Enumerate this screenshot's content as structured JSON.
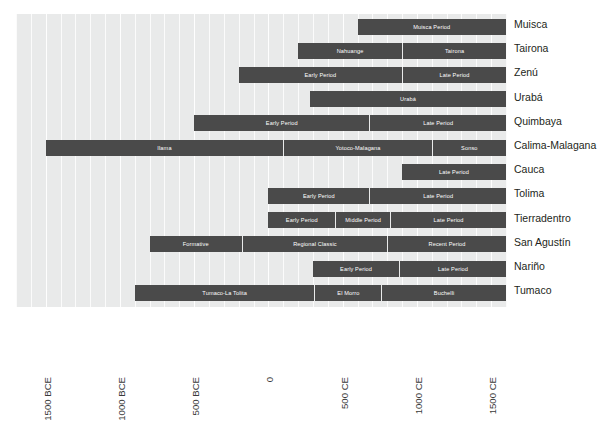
{
  "chart_data": {
    "type": "bar",
    "subtype": "timeline-gantt",
    "title": "",
    "xlabel": "",
    "ylabel": "",
    "xlim": [
      -1700,
      1600
    ],
    "grid": true,
    "grid_interval_years": 100,
    "legend": "none",
    "bar_color": "#4a4a4a",
    "plot_background": "#e9eaea",
    "text_color": "#231f20",
    "axis": {
      "ticks": [
        -1500,
        -1000,
        -500,
        0,
        500,
        1000,
        1500
      ],
      "tick_labels": [
        "1500 BCE",
        "1000 BCE",
        "500 BCE",
        "0",
        "500 CE",
        "1000 CE",
        "1500 CE"
      ],
      "tick_label_rotation": -90
    },
    "categories": [
      "Muisca",
      "Tairona",
      "Zenú",
      "Urabá",
      "Quimbaya",
      "Calima-Malagana",
      "Cauca",
      "Tolima",
      "Tierradentro",
      "San Agustín",
      "Nariño",
      "Tumaco"
    ],
    "rows": [
      {
        "label": "Muisca",
        "segments": [
          {
            "name": "Muisca Period",
            "start": 600,
            "end": 1600
          }
        ]
      },
      {
        "label": "Tairona",
        "segments": [
          {
            "name": "Nahuange",
            "start": 200,
            "end": 900
          },
          {
            "name": "Tairona",
            "start": 900,
            "end": 1600
          }
        ]
      },
      {
        "label": "Zenú",
        "segments": [
          {
            "name": "Early Period",
            "start": -200,
            "end": 900
          },
          {
            "name": "Late Period",
            "start": 900,
            "end": 1600
          }
        ]
      },
      {
        "label": "Urabá",
        "segments": [
          {
            "name": "Urabá",
            "start": 280,
            "end": 1600
          }
        ]
      },
      {
        "label": "Quimbaya",
        "segments": [
          {
            "name": "Early Period",
            "start": -500,
            "end": 680
          },
          {
            "name": "Late Period",
            "start": 680,
            "end": 1600
          }
        ]
      },
      {
        "label": "Calima-Malagana",
        "segments": [
          {
            "name": "Ilama",
            "start": -1500,
            "end": 100
          },
          {
            "name": "Yotoco-Malagana",
            "start": 100,
            "end": 1100
          },
          {
            "name": "Sonso",
            "start": 1100,
            "end": 1600
          }
        ]
      },
      {
        "label": "Cauca",
        "segments": [
          {
            "name": "Late Period",
            "start": 900,
            "end": 1600
          }
        ]
      },
      {
        "label": "Tolima",
        "segments": [
          {
            "name": "Early Period",
            "start": 0,
            "end": 680
          },
          {
            "name": "Late Period",
            "start": 680,
            "end": 1600
          }
        ]
      },
      {
        "label": "Tierradentro",
        "segments": [
          {
            "name": "Early Period",
            "start": 0,
            "end": 450
          },
          {
            "name": "Middle Period",
            "start": 450,
            "end": 820
          },
          {
            "name": "Late Period",
            "start": 820,
            "end": 1600
          }
        ]
      },
      {
        "label": "San Agustín",
        "segments": [
          {
            "name": "Formative",
            "start": -800,
            "end": -180
          },
          {
            "name": "Regional Classic",
            "start": -180,
            "end": 800
          },
          {
            "name": "Recent Period",
            "start": 800,
            "end": 1600
          }
        ]
      },
      {
        "label": "Nariño",
        "segments": [
          {
            "name": "Early Period",
            "start": 300,
            "end": 880
          },
          {
            "name": "Late Period",
            "start": 880,
            "end": 1600
          }
        ]
      },
      {
        "label": "Tumaco",
        "segments": [
          {
            "name": "Tumaco-La Tolita",
            "start": -900,
            "end": 310
          },
          {
            "name": "El  Morro",
            "start": 310,
            "end": 760
          },
          {
            "name": "Buchelli",
            "start": 760,
            "end": 1600
          }
        ]
      }
    ]
  }
}
